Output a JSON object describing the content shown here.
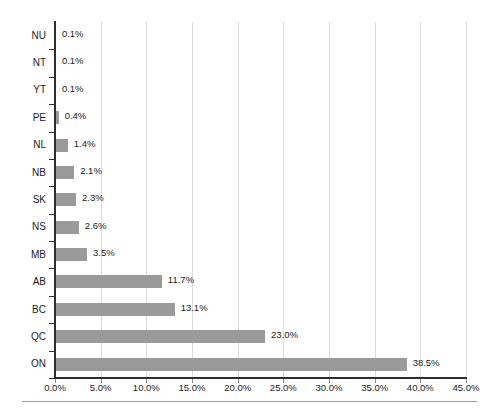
{
  "chart_data": {
    "type": "bar",
    "orientation": "horizontal",
    "title": "",
    "subtitle": "",
    "xlabel": "",
    "ylabel": "",
    "categories": [
      "NU",
      "NT",
      "YT",
      "PE",
      "NL",
      "NB",
      "SK",
      "NS",
      "MB",
      "AB",
      "BC",
      "QC",
      "ON"
    ],
    "values": [
      0.1,
      0.1,
      0.1,
      0.4,
      1.4,
      2.1,
      2.3,
      2.6,
      3.5,
      11.7,
      13.1,
      23.0,
      38.5
    ],
    "value_labels": [
      "0.1%",
      "0.1%",
      "0.1%",
      "0.4%",
      "1.4%",
      "2.1%",
      "2.3%",
      "2.6%",
      "3.5%",
      "11.7%",
      "13.1%",
      "23.0%",
      "38.5%"
    ],
    "xlim": [
      0,
      45
    ],
    "xticks": [
      0,
      5,
      10,
      15,
      20,
      25,
      30,
      35,
      40,
      45
    ],
    "xtick_labels": [
      "0.0%",
      "5.0%",
      "10.0%",
      "15.0%",
      "20.0%",
      "25.0%",
      "30.0%",
      "35.0%",
      "40.0%",
      "45.0%"
    ],
    "grid": "vertical",
    "legend": "none",
    "units": "percent",
    "colors": {
      "bar": "#9a9a9a",
      "gridline": "#dcdcdc",
      "axis": "#2e2e2e",
      "text": "#1b1b1b",
      "rule": "#9d9d9d",
      "background": "#ffffff"
    }
  }
}
